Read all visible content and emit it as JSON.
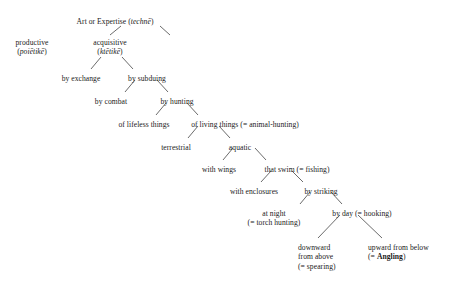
{
  "diagram": {
    "line_color": "#2b2b2b",
    "text_color": "#1a1a1a",
    "background": "#ffffff",
    "nodes": [
      {
        "id": "techne",
        "name": "art-or-expertise",
        "lines": [
          "Art or Expertise (",
          "technē",
          ")"
        ],
        "label": "Art or Expertise (technē)",
        "main": "Art or Expertise (",
        "greek": "technē",
        "tail": ")",
        "second": "",
        "x": 115,
        "y": 17,
        "align": "center"
      },
      {
        "id": "productive",
        "name": "productive",
        "label": "productive (poiētikē)",
        "main": "productive",
        "greek": "poiētikē",
        "second_prefix": "(",
        "second_suffix": ")",
        "x": 32,
        "y": 38,
        "align": "center"
      },
      {
        "id": "acquisitive",
        "name": "acquisitive",
        "label": "acquisitive (ktētikē)",
        "main": "acquisitive",
        "greek": "ktētikē",
        "second_prefix": "(",
        "second_suffix": ")",
        "x": 110,
        "y": 38,
        "align": "center"
      },
      {
        "id": "by-exchange",
        "name": "by-exchange",
        "label": "by exchange",
        "main": "by exchange",
        "x": 81,
        "y": 74,
        "align": "center"
      },
      {
        "id": "by-subduing",
        "name": "by-subduing",
        "label": "by subduing",
        "main": "by subduing",
        "x": 147,
        "y": 74,
        "align": "center"
      },
      {
        "id": "by-combat",
        "name": "by-combat",
        "label": "by combat",
        "main": "by combat",
        "x": 111,
        "y": 97,
        "align": "center"
      },
      {
        "id": "by-hunting",
        "name": "by-hunting",
        "label": "by hunting",
        "main": "by hunting",
        "x": 177,
        "y": 97,
        "align": "center"
      },
      {
        "id": "of-lifeless-things",
        "name": "of-lifeless-things",
        "label": "of lifeless things",
        "main": "of lifeless things",
        "x": 144,
        "y": 120,
        "align": "center"
      },
      {
        "id": "of-living-things",
        "name": "of-living-things",
        "label": "of living things (= animal-hunting)",
        "main": "of living things (= animal-hunting)",
        "x": 245,
        "y": 120,
        "align": "center"
      },
      {
        "id": "terrestrial",
        "name": "terrestrial",
        "label": "terrestrial",
        "main": "terrestrial",
        "x": 176,
        "y": 143,
        "align": "center"
      },
      {
        "id": "aquatic",
        "name": "aquatic",
        "label": "aquatic",
        "main": "aquatic",
        "x": 240,
        "y": 143,
        "align": "center"
      },
      {
        "id": "with-wings",
        "name": "with-wings",
        "label": "with wings",
        "main": "with wings",
        "x": 219,
        "y": 165,
        "align": "center"
      },
      {
        "id": "that-swim",
        "name": "that-swim-fishing",
        "label": "that swim (= fishing)",
        "main": "that swim (= fishing)",
        "x": 297,
        "y": 165,
        "align": "center"
      },
      {
        "id": "with-enclosures",
        "name": "with-enclosures",
        "label": "with enclosures",
        "main": "with enclosures",
        "x": 254,
        "y": 187,
        "align": "center"
      },
      {
        "id": "by-striking",
        "name": "by-striking",
        "label": "by striking",
        "main": "by striking",
        "x": 321,
        "y": 187,
        "align": "center"
      },
      {
        "id": "at-night",
        "name": "at-night-torch-hunting",
        "label": "at night (= torch hunting)",
        "main": "at night",
        "second": "(= torch hunting)",
        "x": 274,
        "y": 209,
        "align": "center"
      },
      {
        "id": "by-day",
        "name": "by-day-hooking",
        "label": "by day (= hooking)",
        "main": "by day (= hooking)",
        "x": 362,
        "y": 209,
        "align": "center"
      },
      {
        "id": "downward",
        "name": "downward-from-above-spearing",
        "label": "downward from above (= spearing)",
        "line1": "downward",
        "line2": "from above",
        "line3": "(= spearing)",
        "x": 298,
        "y": 243,
        "align": "left"
      },
      {
        "id": "upward",
        "name": "upward-from-below-angling",
        "label": "upward from below (= Angling)",
        "line1": "upward from below",
        "line2_prefix": "(= ",
        "line2_bold": "Angling",
        "line2_suffix": ")",
        "x": 368,
        "y": 243,
        "align": "left"
      }
    ],
    "edges": [
      {
        "name": "edge-techne-productive",
        "from": "techne",
        "to": "productive",
        "x1": 121,
        "y1": 26,
        "x2": 110,
        "y2": 35
      },
      {
        "name": "edge-techne-acquisitive",
        "from": "techne",
        "to": "acquisitive",
        "x1": 160,
        "y1": 26,
        "x2": 170,
        "y2": 35
      },
      {
        "name": "edge-acquisitive-by-exchange",
        "from": "acquisitive",
        "to": "by-exchange",
        "x1": 101,
        "y1": 57,
        "x2": 91,
        "y2": 69
      },
      {
        "name": "edge-acquisitive-by-subduing",
        "from": "acquisitive",
        "to": "by-subduing",
        "x1": 122,
        "y1": 57,
        "x2": 133,
        "y2": 69
      },
      {
        "name": "edge-by-subduing-by-combat",
        "from": "by-subduing",
        "to": "by-combat",
        "x1": 135,
        "y1": 80,
        "x2": 125,
        "y2": 92
      },
      {
        "name": "edge-by-subduing-by-hunting",
        "from": "by-subduing",
        "to": "by-hunting",
        "x1": 157,
        "y1": 80,
        "x2": 168,
        "y2": 92
      },
      {
        "name": "edge-by-hunting-of-lifeless",
        "from": "by-hunting",
        "to": "of-lifeless-things",
        "x1": 166,
        "y1": 103,
        "x2": 156,
        "y2": 115
      },
      {
        "name": "edge-by-hunting-of-living",
        "from": "by-hunting",
        "to": "of-living-things",
        "x1": 187,
        "y1": 103,
        "x2": 198,
        "y2": 115
      },
      {
        "name": "edge-of-living-terrestrial",
        "from": "of-living-things",
        "to": "terrestrial",
        "x1": 198,
        "y1": 126,
        "x2": 188,
        "y2": 138
      },
      {
        "name": "edge-of-living-aquatic",
        "from": "of-living-things",
        "to": "aquatic",
        "x1": 219,
        "y1": 126,
        "x2": 230,
        "y2": 138
      },
      {
        "name": "edge-aquatic-with-wings",
        "from": "aquatic",
        "to": "with-wings",
        "x1": 233,
        "y1": 148,
        "x2": 223,
        "y2": 160
      },
      {
        "name": "edge-aquatic-that-swim",
        "from": "aquatic",
        "to": "that-swim",
        "x1": 255,
        "y1": 148,
        "x2": 266,
        "y2": 160
      },
      {
        "name": "edge-that-swim-with-enclosures",
        "from": "that-swim",
        "to": "with-enclosures",
        "x1": 271,
        "y1": 171,
        "x2": 261,
        "y2": 182
      },
      {
        "name": "edge-that-swim-by-striking",
        "from": "that-swim",
        "to": "by-striking",
        "x1": 292,
        "y1": 171,
        "x2": 303,
        "y2": 182
      },
      {
        "name": "edge-by-striking-at-night",
        "from": "by-striking",
        "to": "at-night",
        "x1": 310,
        "y1": 192,
        "x2": 300,
        "y2": 204
      },
      {
        "name": "edge-by-striking-by-day",
        "from": "by-striking",
        "to": "by-day",
        "x1": 331,
        "y1": 192,
        "x2": 342,
        "y2": 204
      },
      {
        "name": "edge-by-day-downward",
        "from": "by-day",
        "to": "downward",
        "x1": 340,
        "y1": 215,
        "x2": 318,
        "y2": 238
      },
      {
        "name": "edge-by-day-upward",
        "from": "by-day",
        "to": "upward",
        "x1": 358,
        "y1": 215,
        "x2": 382,
        "y2": 238
      }
    ]
  }
}
